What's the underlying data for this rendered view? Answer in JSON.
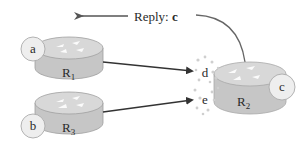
{
  "diagram": {
    "reply_label": "Reply: ",
    "reply_value": "c",
    "routers": [
      {
        "id": "R1",
        "letter": "R",
        "sub": "1",
        "host": "a"
      },
      {
        "id": "R3",
        "letter": "R",
        "sub": "3",
        "host": "b"
      },
      {
        "id": "R2",
        "letter": "R",
        "sub": "2",
        "host": "c"
      }
    ],
    "ports": [
      {
        "label": "d"
      },
      {
        "label": "e"
      }
    ],
    "colors": {
      "router_body": "#c9c9c9",
      "router_top": "#dcdcdc",
      "router_edge": "#9a9a9a",
      "host_fill": "#eeeeee",
      "arrow": "#333333",
      "dots": "#c8c8c8"
    }
  }
}
